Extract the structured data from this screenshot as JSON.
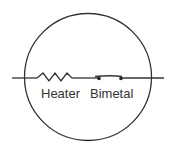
{
  "diagram": {
    "type": "circuit-symbol",
    "components": [
      {
        "id": "heater",
        "label": "Heater",
        "symbol": "resistor-zigzag"
      },
      {
        "id": "bimetal",
        "label": "Bimetal",
        "symbol": "bimetal-switch"
      }
    ],
    "enclosure": "circle",
    "colors": {
      "stroke": "#333333",
      "background": "#ffffff"
    }
  }
}
